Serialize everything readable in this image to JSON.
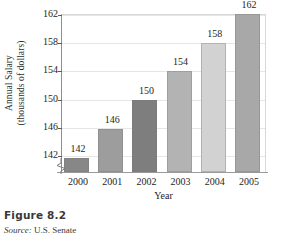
{
  "figure": {
    "title": "Figure 8.2",
    "source_word": "Source:",
    "source_text": "U.S. Senate"
  },
  "chart_data": {
    "type": "bar",
    "title": "",
    "xlabel": "Year",
    "ylabel_line1": "Annual Salary",
    "ylabel_line2": "(thousands of dollars)",
    "categories": [
      "2000",
      "2001",
      "2002",
      "2003",
      "2004",
      "2005"
    ],
    "values": [
      142,
      146,
      150,
      154,
      158,
      162
    ],
    "data_labels": [
      "142",
      "146",
      "150",
      "154",
      "158",
      "162"
    ],
    "ylim": [
      140,
      162
    ],
    "yticks": [
      142,
      146,
      150,
      154,
      158,
      162
    ],
    "ytick_labels": [
      "142",
      "146",
      "150",
      "154",
      "158",
      "162"
    ],
    "grid": true,
    "axis_break": true,
    "legend": "none",
    "bar_colors": [
      "#878787",
      "#9d9d9d",
      "#7e7e7e",
      "#b3b3b3",
      "#d2d2d2",
      "#a8a8a8"
    ]
  }
}
